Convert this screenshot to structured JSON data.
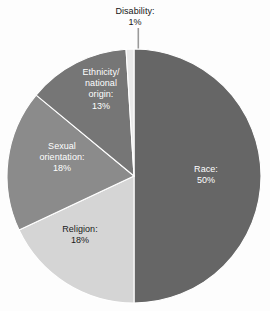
{
  "background_color": "#fdfdfd",
  "chart_data": {
    "type": "pie",
    "title": "",
    "subtitle": "",
    "xlabel": "",
    "ylabel": "",
    "legend_position": "none",
    "grid": false,
    "labels_inside_slices": true,
    "start_angle_deg": 0,
    "direction": "clockwise",
    "center": {
      "x": 134,
      "y": 176
    },
    "radius": 127,
    "categories": [
      "Race",
      "Religion",
      "Sexual orientation",
      "Ethnicity/national origin",
      "Disability"
    ],
    "values": [
      50,
      18,
      18,
      13,
      1
    ],
    "unit": "%",
    "slices": [
      {
        "name": "Race",
        "value": 50,
        "value_text": "50%",
        "label_text": "Race:\n50%",
        "color": "#666666",
        "text_color": "#ffffff",
        "label_placement": "inside"
      },
      {
        "name": "Religion",
        "value": 18,
        "value_text": "18%",
        "label_text": "Religion:\n18%",
        "color": "#d5d5d5",
        "text_color": "#1b1b1b",
        "label_placement": "inside"
      },
      {
        "name": "Sexual orientation",
        "value": 18,
        "value_text": "18%",
        "label_text": "Sexual\norientation:\n18%",
        "color": "#8b8b8b",
        "text_color": "#ffffff",
        "label_placement": "inside"
      },
      {
        "name": "Ethnicity/national origin",
        "value": 13,
        "value_text": "13%",
        "label_text": "Ethnicity/\nnational\norigin:\n13%",
        "color": "#767676",
        "text_color": "#ffffff",
        "label_placement": "inside"
      },
      {
        "name": "Disability",
        "value": 1,
        "value_text": "1%",
        "label_text": "Disability:\n1%",
        "color": "#e9e9e9",
        "text_color": "#161616",
        "label_placement": "outside-with-leader-line"
      }
    ]
  }
}
